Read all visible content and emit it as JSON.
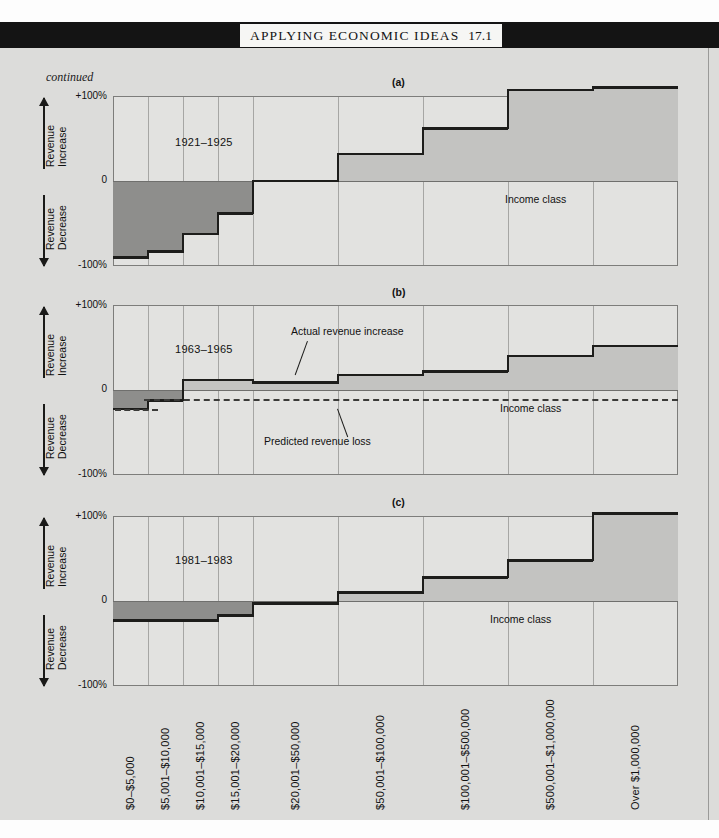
{
  "header": {
    "banner_title": "APPLYING ECONOMIC IDEAS",
    "banner_number": "17.1"
  },
  "continued_note": "continued",
  "axis": {
    "top_label": "+100%",
    "zero_label": "0",
    "bottom_label": "-100%",
    "increase_label_line1": "Revenue",
    "increase_label_line2": "Increase",
    "decrease_label_line1": "Revenue",
    "decrease_label_line2": "Decrease",
    "x_axis_title": "Income class"
  },
  "annotations": {
    "actual": "Actual revenue increase",
    "predicted": "Predicted revenue loss"
  },
  "colors": {
    "page_background": "#dcdcda",
    "banner": "#141414",
    "plot_background": "#e2e2e0",
    "positive_fill": "#c3c3c1",
    "negative_fill": "#8e8e8c",
    "outline": "#1d1d1b",
    "gridline": "#a6a6a4"
  },
  "chart_data": [
    {
      "type": "bar",
      "panel": "(a)",
      "title": "(a)",
      "period": "1921–1925",
      "xlabel": "Income class",
      "ylabel": "Revenue Increase / Revenue Decrease",
      "ylim": [
        -100,
        100
      ],
      "ytick_labels": [
        "+100%",
        "0",
        "-100%"
      ],
      "categories": [
        "$0–$5,000",
        "$5,001–$10,000",
        "$10,001–$15,000",
        "$15,001–$20,000",
        "$20,001–$50,000",
        "$50,001–$100,000",
        "$100,001–$500,000",
        "$500,001–$1,000,000",
        "Over $1,000,000"
      ],
      "values": [
        -90,
        -83,
        -62,
        -38,
        0,
        32,
        62,
        107,
        110
      ],
      "grid": true,
      "legend": "none"
    },
    {
      "type": "bar",
      "panel": "(b)",
      "title": "(b)",
      "period": "1963–1965",
      "xlabel": "Income class",
      "ylabel": "Revenue Increase / Revenue Decrease",
      "ylim": [
        -100,
        100
      ],
      "ytick_labels": [
        "+100%",
        "0",
        "-100%"
      ],
      "categories": [
        "$0–$5,000",
        "$5,001–$10,000",
        "$10,001–$15,000",
        "$15,001–$20,000",
        "$20,001–$50,000",
        "$50,001–$100,000",
        "$100,001–$500,000",
        "$500,001–$1,000,000",
        "Over $1,000,000"
      ],
      "series": [
        {
          "name": "Actual revenue increase",
          "values": [
            -22,
            -12,
            12,
            12,
            9,
            18,
            22,
            40,
            52
          ]
        },
        {
          "name": "Predicted revenue loss",
          "type": "dashed-line",
          "values": [
            -22,
            -10,
            -10,
            -10,
            -10,
            -10,
            -10,
            -10,
            -10
          ]
        }
      ],
      "grid": true,
      "legend": "annotations"
    },
    {
      "type": "bar",
      "panel": "(c)",
      "title": "(c)",
      "period": "1981–1983",
      "xlabel": "Income class",
      "ylabel": "Revenue Increase / Revenue Decrease",
      "ylim": [
        -100,
        100
      ],
      "ytick_labels": [
        "+100%",
        "0",
        "-100%"
      ],
      "categories": [
        "$0–$5,000",
        "$5,001–$10,000",
        "$10,001–$15,000",
        "$15,001–$20,000",
        "$20,001–$50,000",
        "$50,001–$100,000",
        "$100,001–$500,000",
        "$500,001–$1,000,000",
        "Over $1,000,000"
      ],
      "values": [
        -23,
        -23,
        -23,
        -17,
        -3,
        10,
        28,
        48,
        103
      ],
      "grid": true,
      "legend": "none"
    }
  ],
  "x_categories": [
    "$0–$5,000",
    "$5,001–$10,000",
    "$10,001–$15,000",
    "$15,001–$20,000",
    "$20,001–$50,000",
    "$50,001–$100,000",
    "$100,001–$500,000",
    "$500,001–$1,000,000",
    "Over $1,000,000"
  ]
}
